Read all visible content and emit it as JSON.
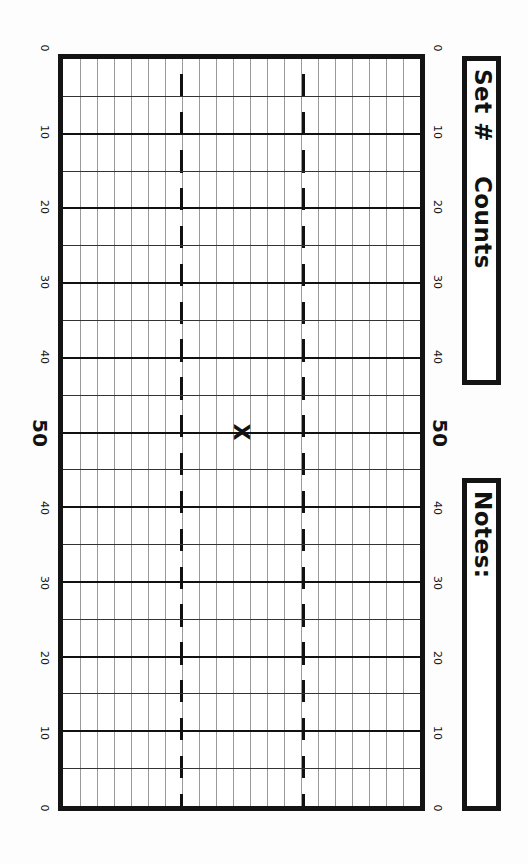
{
  "header_box": {
    "set_label": "Set #",
    "counts_label": "Counts"
  },
  "notes_box": {
    "label": "Notes:"
  },
  "field": {
    "yard_labels": [
      "0",
      "10",
      "20",
      "30",
      "40",
      "50",
      "40",
      "30",
      "20",
      "10",
      "0"
    ],
    "center_marker": "X",
    "hash_columns": 2,
    "grid_columns": 21
  },
  "colors": {
    "ink": "#141414",
    "grid_minor": "#9a9a9a",
    "paper": "#ffffff"
  }
}
